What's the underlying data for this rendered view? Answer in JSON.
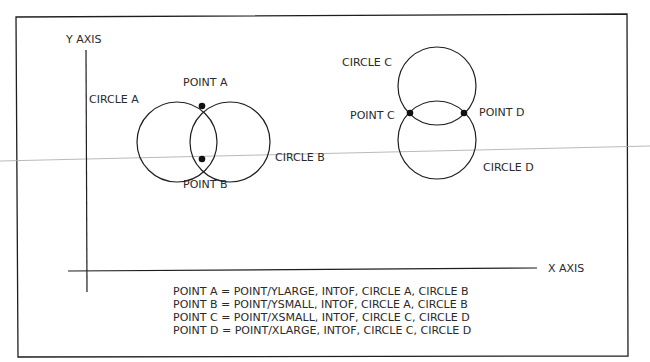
{
  "diagram": {
    "axes": {
      "y_label": "Y AXIS",
      "x_label": "X AXIS"
    },
    "circles": [
      {
        "id": "A",
        "label": "CIRCLE A",
        "cx": 177,
        "cy": 142,
        "r": 40
      },
      {
        "id": "B",
        "label": "CIRCLE B",
        "cx": 230,
        "cy": 142,
        "r": 40
      },
      {
        "id": "C",
        "label": "CIRCLE C",
        "cx": 437,
        "cy": 86,
        "r": 39
      },
      {
        "id": "D",
        "label": "CIRCLE D",
        "cx": 437,
        "cy": 140,
        "r": 39
      }
    ],
    "points": [
      {
        "id": "A",
        "label": "POINT A",
        "x": 202,
        "y": 106
      },
      {
        "id": "B",
        "label": "POINT B",
        "x": 202,
        "y": 159
      },
      {
        "id": "C",
        "label": "POINT C",
        "x": 410,
        "y": 113
      },
      {
        "id": "D",
        "label": "POINT D",
        "x": 464,
        "y": 113
      }
    ],
    "definitions": [
      "POINT A = POINT/YLARGE, INTOF,  CIRCLE A, CIRCLE B",
      "POINT B = POINT/YSMALL, INTOF,  CIRCLE A, CIRCLE B",
      "POINT C = POINT/XSMALL, INTOF,  CIRCLE C, CIRCLE D",
      "POINT D = POINT/XLARGE, INTOF,  CIRCLE C, CIRCLE D"
    ],
    "colors": {
      "line": "#1e1e1e",
      "text": "#2a2a2a",
      "scan_line": "#a8a8a8"
    }
  }
}
